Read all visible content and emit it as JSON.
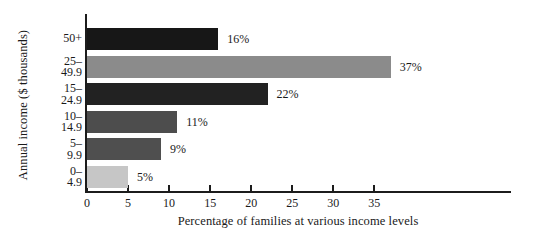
{
  "chart_data": {
    "type": "bar",
    "orientation": "horizontal",
    "title": "",
    "xlabel": "Percentage of families at various income levels",
    "ylabel": "Annual income ($ thousands)",
    "categories": [
      "50+",
      "25–49.9",
      "15–24.9",
      "10–14.9",
      "5–9.9",
      "0–4.9"
    ],
    "category_lines": [
      [
        "50+",
        ""
      ],
      [
        "25–",
        "49.9"
      ],
      [
        "15–",
        "24.9"
      ],
      [
        "10–",
        "14.9"
      ],
      [
        "5–",
        "9.9"
      ],
      [
        "0–",
        "4.9"
      ]
    ],
    "values": [
      16,
      37,
      22,
      11,
      9,
      5
    ],
    "value_labels": [
      "16%",
      "37%",
      "22%",
      "11%",
      "9%",
      "5%"
    ],
    "bar_colors": [
      "#171717",
      "#8b8b8b",
      "#222222",
      "#4d4d4d",
      "#4f4f4f",
      "#c6c6c6"
    ],
    "xlim": [
      0,
      40
    ],
    "xticks": [
      0,
      5,
      10,
      15,
      20,
      25,
      30,
      35
    ],
    "xtick_labels": [
      "0",
      "5",
      "10",
      "15",
      "20",
      "25",
      "30",
      "35"
    ],
    "grid": false,
    "legend": "none",
    "axis_color": "#1c1c1c"
  }
}
